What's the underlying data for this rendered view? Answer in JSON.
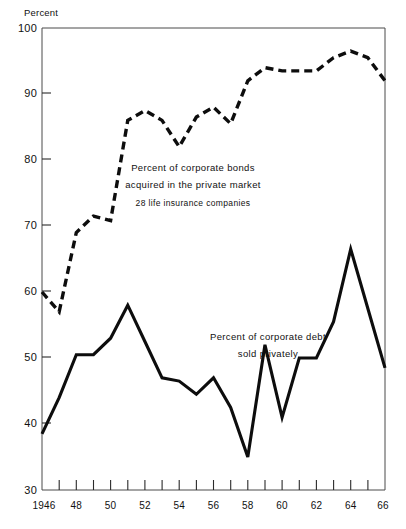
{
  "chart_data": {
    "type": "line",
    "title": "",
    "subtitle": "",
    "xlabel": "",
    "ylabel": "Percent",
    "ylim": [
      30,
      100
    ],
    "xlim": [
      1946,
      1966
    ],
    "grid": false,
    "legend_position": "inline-annotation",
    "y_ticks": [
      30,
      40,
      50,
      60,
      70,
      80,
      90,
      100
    ],
    "y_tick_labels": [
      "30",
      "40",
      "50",
      "60",
      "70",
      "80",
      "90",
      "100"
    ],
    "x_ticks": [
      1946,
      1947,
      1948,
      1949,
      1950,
      1951,
      1952,
      1953,
      1954,
      1955,
      1956,
      1957,
      1958,
      1959,
      1960,
      1961,
      1962,
      1963,
      1964,
      1965,
      1966
    ],
    "x_tick_labels": [
      "1946",
      "48",
      "50",
      "52",
      "54",
      "56",
      "58",
      "60",
      "62",
      "64",
      "66"
    ],
    "x_labeled_years": [
      1946,
      1948,
      1950,
      1952,
      1954,
      1956,
      1958,
      1960,
      1962,
      1964,
      1966
    ],
    "x": [
      1946,
      1947,
      1948,
      1949,
      1950,
      1951,
      1952,
      1953,
      1954,
      1955,
      1956,
      1957,
      1958,
      1959,
      1960,
      1961,
      1962,
      1963,
      1964,
      1965,
      1966
    ],
    "series": [
      {
        "name": "Percent of corporate bonds acquired in the private market, 28 life insurance companies",
        "style": "dashed",
        "values": [
          60.0,
          57.0,
          69.0,
          71.5,
          70.8,
          86.0,
          87.5,
          86.0,
          82.0,
          86.5,
          88.0,
          85.5,
          92.0,
          94.0,
          93.5,
          93.5,
          93.5,
          95.5,
          96.5,
          95.5,
          92.0
        ]
      },
      {
        "name": "Percent of corporate debt sold privately",
        "style": "solid",
        "values": [
          38.5,
          44.0,
          50.5,
          50.5,
          53.0,
          58.0,
          52.5,
          47.0,
          46.5,
          44.5,
          47.0,
          42.5,
          35.0,
          52.0,
          41.0,
          50.0,
          50.0,
          55.5,
          66.5,
          57.5,
          48.5
        ]
      }
    ],
    "annotations": [
      {
        "id": "annotation-bonds",
        "lines": [
          "Percent of corporate bonds",
          "acquired in the private market",
          "28 life insurance companies"
        ],
        "series": "Percent of corporate bonds acquired in the private market, 28 life insurance companies"
      },
      {
        "id": "annotation-debt",
        "lines": [
          "Percent of corporate debt",
          "sold privately"
        ],
        "series": "Percent of corporate debt sold privately"
      }
    ]
  },
  "axis": {
    "y_title": "Percent",
    "y_labels": [
      "100",
      "90",
      "80",
      "70",
      "60",
      "50",
      "40",
      "30"
    ],
    "x_labels": [
      "1946",
      "48",
      "50",
      "52",
      "54",
      "56",
      "58",
      "60",
      "62",
      "64",
      "66"
    ]
  },
  "annotations": {
    "bonds": {
      "line1": "Percent of corporate bonds",
      "line2": "acquired in the private market",
      "line3": "28 life insurance companies"
    },
    "debt": {
      "line1": "Percent of corporate debt",
      "line2": "sold privately"
    }
  },
  "colors": {
    "ink": "#0d0d0d",
    "frame": "#4a4a4a",
    "background": "#ffffff"
  }
}
